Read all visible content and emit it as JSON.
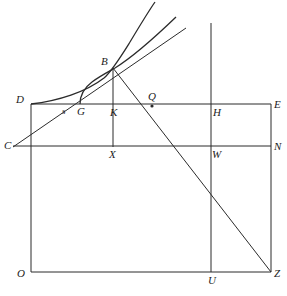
{
  "figure": {
    "type": "line-diagram",
    "stroke_color": "#2b2b2b",
    "background_color": "#ffffff",
    "label_color": "#1b1b1b"
  },
  "labels": {
    "B": "B",
    "D": "D",
    "C": "C",
    "s": "s",
    "G": "G",
    "K": "K",
    "Q": "Q",
    "H": "H",
    "E": "E",
    "X": "X",
    "W": "W",
    "N": "N",
    "O": "O",
    "U": "U",
    "Z": "Z"
  },
  "geometry": {
    "points": {
      "B": [
        113,
        68
      ],
      "D": [
        31,
        104
      ],
      "C": [
        22,
        146
      ],
      "G": [
        80,
        104
      ],
      "s": [
        63,
        104
      ],
      "K": [
        113,
        104
      ],
      "Q": [
        152,
        104
      ],
      "H": [
        211,
        104
      ],
      "E": [
        271,
        104
      ],
      "X": [
        113,
        146
      ],
      "W": [
        211,
        146
      ],
      "N": [
        271,
        146
      ],
      "O": [
        31,
        272
      ],
      "U": [
        211,
        272
      ],
      "Z": [
        271,
        272
      ]
    },
    "rectangles": [
      {
        "name": "outer-rect",
        "x1": 31,
        "y1": 104,
        "x2": 271,
        "y2": 272
      },
      {
        "name": "inner-band-DE-CN",
        "x1": 31,
        "y1": 104,
        "x2": 271,
        "y2": 146
      }
    ],
    "segments": [
      {
        "name": "line-DE",
        "from": "D",
        "to": "E"
      },
      {
        "name": "line-CN",
        "from": "C",
        "to": "N"
      },
      {
        "name": "line-OZ",
        "from": "O",
        "to": "Z"
      },
      {
        "name": "line-DO",
        "from": "D",
        "to": "O"
      },
      {
        "name": "line-EZ",
        "from": "E",
        "to": "Z"
      },
      {
        "name": "line-BX-vertical",
        "from": "B",
        "to": "X"
      },
      {
        "name": "line-HU-vertical",
        "from": [
          211,
          23
        ],
        "to": "U"
      },
      {
        "name": "line-BZ",
        "from": "B",
        "to": "Z"
      },
      {
        "name": "tangent-through-C-B",
        "from": "C",
        "to": [
          186,
          28
        ]
      }
    ],
    "curves": [
      {
        "name": "curve-D-to-B",
        "start": "D",
        "end": "B",
        "continues_to": [
          155,
          2
        ]
      },
      {
        "name": "curve-G-to-B",
        "start": "G",
        "end": "B",
        "continues_to": [
          176,
          17
        ]
      }
    ],
    "markers": [
      {
        "name": "point-Q-dot",
        "at": [
          152,
          106
        ],
        "radius": 1.6
      }
    ]
  }
}
